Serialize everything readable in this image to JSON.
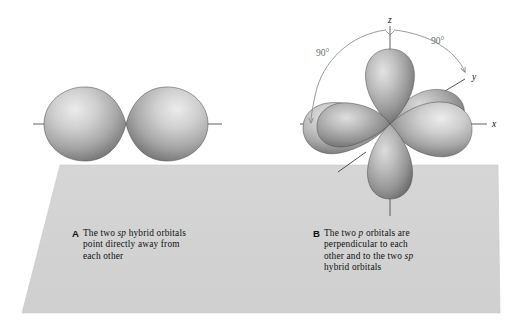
{
  "figure": {
    "background_color": "#ffffff",
    "plane": {
      "name": "reference-plane",
      "color": "#d3d3d3",
      "edge_color": "#c4c4c4"
    },
    "orbital_colors": {
      "highlight": "#e8e8e8",
      "mid": "#b4b4b4",
      "shadow": "#5f5f5f",
      "outline": "#4a4a4a"
    },
    "axis_color": "#555555",
    "arc_color": "#8a8a8a"
  },
  "panelA": {
    "label": "A",
    "line1": "The two ",
    "em1": "sp",
    "line1b": " hybrid orbitals",
    "line2": "point directly away from",
    "line3": "each other",
    "full_text": "The two sp hybrid orbitals point directly away from each other",
    "orbitals": [
      {
        "name": "sp-hybrid-lobe-left",
        "direction": "left"
      },
      {
        "name": "sp-hybrid-lobe-right",
        "direction": "right"
      }
    ],
    "axis_label": ""
  },
  "panelB": {
    "label": "B",
    "line1": "The two ",
    "em1": "p",
    "line1b": " orbitals are",
    "line2": "perpendicular to each",
    "line3": "other and to the two ",
    "em2": "sp",
    "line4": "hybrid orbitals",
    "full_text": "The two p orbitals are perpendicular to each other and to the two sp hybrid orbitals",
    "axes": [
      {
        "name": "axis-label-z",
        "text": "z"
      },
      {
        "name": "axis-label-y",
        "text": "y"
      },
      {
        "name": "axis-label-x",
        "text": "x"
      }
    ],
    "angles": [
      {
        "name": "angle-label-left",
        "text": "90°"
      },
      {
        "name": "angle-label-right",
        "text": "90°"
      }
    ],
    "orbitals": [
      {
        "name": "p-orbital-lobe-z-up",
        "direction": "up"
      },
      {
        "name": "p-orbital-lobe-z-down",
        "direction": "down"
      },
      {
        "name": "p-orbital-lobe-x-right",
        "direction": "right"
      },
      {
        "name": "p-orbital-lobe-x-left",
        "direction": "left"
      },
      {
        "name": "sp-hybrid-lobe-y-front",
        "direction": "front"
      },
      {
        "name": "sp-hybrid-lobe-y-back",
        "direction": "back"
      }
    ]
  }
}
